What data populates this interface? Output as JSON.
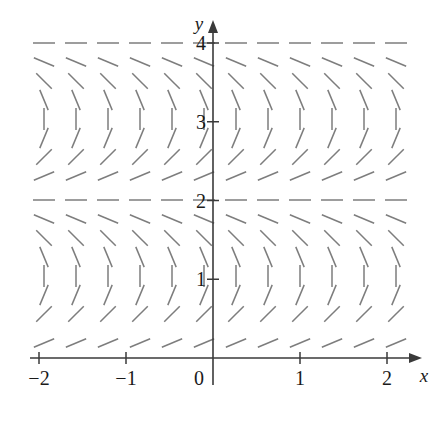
{
  "figure": {
    "kind": "slope-field",
    "background_color": "#ffffff",
    "segment_color": "#7d7d7d",
    "axis_color": "#3a3a3a",
    "label_color": "#1a1a1a"
  },
  "axes": {
    "x_label": "x",
    "y_label": "y",
    "x_ticks": [
      {
        "label": "−2",
        "value": -2
      },
      {
        "label": "−1",
        "value": -1
      },
      {
        "label": "0",
        "value": 0
      },
      {
        "label": "1",
        "value": 1
      },
      {
        "label": "2",
        "value": 2
      }
    ],
    "y_ticks": [
      {
        "label": "1",
        "value": 1
      },
      {
        "label": "2",
        "value": 2
      },
      {
        "label": "3",
        "value": 3
      },
      {
        "label": "4",
        "value": 4
      }
    ]
  },
  "chart_data": {
    "type": "scatter",
    "title": "",
    "xlabel": "x",
    "ylabel": "y",
    "xlim": [
      -2.15,
      2.15
    ],
    "ylim": [
      0,
      4.25
    ],
    "grid": false,
    "legend": null,
    "x": [
      -2.0,
      -1.8181,
      -1.6363,
      -1.4545,
      -1.2727,
      -1.0909,
      -0.909,
      -0.7272,
      -0.5454,
      -0.3636,
      -0.1818,
      0.0,
      0.1818,
      0.3636,
      0.5454,
      0.7272,
      0.909,
      1.0909,
      1.2727,
      1.4545,
      1.6363,
      1.8181,
      2.0
    ],
    "y": [
      0.25,
      0.5,
      0.75,
      1.0,
      1.25,
      1.5,
      1.75,
      2.0,
      2.25,
      2.5,
      2.75,
      3.0,
      3.25,
      3.5,
      3.75,
      4.0
    ],
    "slope_rule": "angle_deg = 90 * (2 - y) ; slope = tan(angle)",
    "row_angles_deg": [
      {
        "y": 0.25,
        "angle_deg": 22.5
      },
      {
        "y": 0.5,
        "angle_deg": 45
      },
      {
        "y": 0.75,
        "angle_deg": 67.5
      },
      {
        "y": 1.0,
        "angle_deg": 90
      },
      {
        "y": 1.25,
        "angle_deg": 112.5
      },
      {
        "y": 1.5,
        "angle_deg": 135
      },
      {
        "y": 1.75,
        "angle_deg": 157.5
      },
      {
        "y": 2.0,
        "angle_deg": 180
      },
      {
        "y": 2.25,
        "angle_deg": 22.5
      },
      {
        "y": 2.5,
        "angle_deg": 45
      },
      {
        "y": 2.75,
        "angle_deg": 67.5
      },
      {
        "y": 3.0,
        "angle_deg": 90
      },
      {
        "y": 3.25,
        "angle_deg": 112.5
      },
      {
        "y": 3.5,
        "angle_deg": 135
      },
      {
        "y": 3.75,
        "angle_deg": 157.5
      },
      {
        "y": 4.0,
        "angle_deg": 180
      }
    ],
    "columns": 12,
    "rows": 16,
    "column_x_pixels": [
      44,
      76,
      108,
      140,
      172,
      204,
      236,
      268,
      300,
      332,
      364,
      396
    ],
    "row_y_pixels": [
      43,
      62,
      81,
      100,
      119,
      138,
      157,
      176,
      200,
      219,
      238,
      257,
      276,
      295,
      314,
      343
    ],
    "segment_length_px": 22
  },
  "geometry": {
    "origin_px": {
      "x": 213,
      "y": 358
    },
    "unit_px": {
      "x": 87,
      "y": 78.75
    },
    "x_axis_y_px": 358,
    "y_axis_x_px": 213,
    "x_axis_start_px": 30,
    "x_axis_end_px": 420,
    "y_axis_top_px": 22,
    "y_axis_bottom_px": 385
  }
}
